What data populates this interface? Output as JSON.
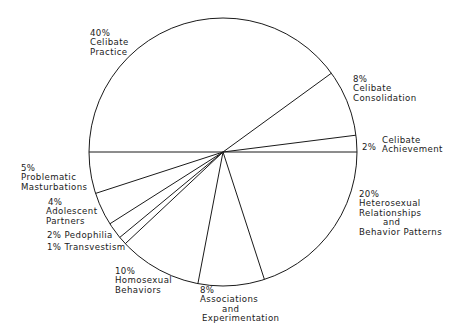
{
  "chart_data": {
    "type": "pie",
    "title": "",
    "start_angle_deg": 180,
    "direction": "clockwise",
    "slices": [
      {
        "label": "Celibate Practice",
        "value": 40,
        "pct_text": "40%"
      },
      {
        "label": "Celibate Consolidation",
        "value": 8,
        "pct_text": "8%"
      },
      {
        "label": "Celibate Achievement",
        "value": 2,
        "pct_text": "2%"
      },
      {
        "label": "Heterosexual Relationships and Behavior Patterns",
        "value": 20,
        "pct_text": "20%"
      },
      {
        "label": "Associations and Experimentation",
        "value": 8,
        "pct_text": "8%"
      },
      {
        "label": "Homosexual Behaviors",
        "value": 10,
        "pct_text": "10%"
      },
      {
        "label": "Transvestism",
        "value": 1,
        "pct_text": "1%"
      },
      {
        "label": "Pedophilia",
        "value": 2,
        "pct_text": "2%"
      },
      {
        "label": "Adolescent Partners",
        "value": 4,
        "pct_text": "4%"
      },
      {
        "label": "Problematic Masturbations",
        "value": 5,
        "pct_text": "5%"
      }
    ],
    "colors": {
      "stroke": "#1a1a1a",
      "fill": "#ffffff"
    }
  },
  "labels": {
    "celibate_practice": {
      "pct": "40%",
      "l1": "Celibate",
      "l2": "Practice"
    },
    "celibate_consolidation": {
      "pct": "8%",
      "l1": "Celibate",
      "l2": "Consolidation"
    },
    "celibate_achievement": {
      "pct": "2%",
      "l1": "Celibate",
      "l2": "Achievement"
    },
    "heterosexual": {
      "pct": "20%",
      "l1": "Heterosexual",
      "l2": "Relationships",
      "l3": "and",
      "l4": "Behavior Patterns"
    },
    "associations": {
      "pct": "8%",
      "l1": "Associations",
      "l2": "and",
      "l3": "Experimentation"
    },
    "homosexual": {
      "pct": "10%",
      "l1": "Homosexual",
      "l2": "Behaviors"
    },
    "transvestism": {
      "text": "1% Transvestism"
    },
    "pedophilia": {
      "text": "2% Pedophilia"
    },
    "adolescent": {
      "pct": "4%",
      "l1": "Adolescent",
      "l2": "Partners"
    },
    "masturbation": {
      "pct": "5%",
      "l1": "Problematic",
      "l2": "Masturbations"
    }
  }
}
